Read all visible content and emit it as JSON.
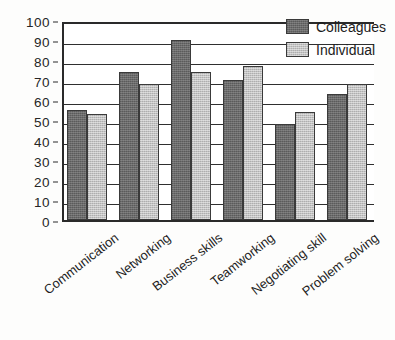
{
  "chart_data": {
    "type": "bar",
    "title": "",
    "xlabel": "",
    "ylabel": "",
    "ylim": [
      0,
      100
    ],
    "ytick_step": 10,
    "yticks": [
      100,
      90,
      80,
      70,
      60,
      50,
      40,
      30,
      20,
      10,
      0
    ],
    "grid": true,
    "grid_axis": "y",
    "legend_position": "top-right",
    "categories": [
      "Communication",
      "Networking",
      "Business skills",
      "Teamworking",
      "Negotiating skill",
      "Problem solving"
    ],
    "series": [
      {
        "name": "Colleagues",
        "color": "#6a6a6a",
        "values": [
          55,
          74,
          90,
          70,
          48,
          63
        ]
      },
      {
        "name": "Individual",
        "color": "#c2c2c2",
        "values": [
          53,
          68,
          74,
          77,
          54,
          68
        ]
      }
    ]
  },
  "legend": {
    "items": [
      {
        "label": "Colleagues",
        "swatch": "colleagues"
      },
      {
        "label": "Individual",
        "swatch": "individual"
      }
    ]
  },
  "colors": {
    "colleagues": "#6a6a6a",
    "individual": "#c2c2c2",
    "axis": "#2a2a2a",
    "background": "#fdfdfc"
  }
}
